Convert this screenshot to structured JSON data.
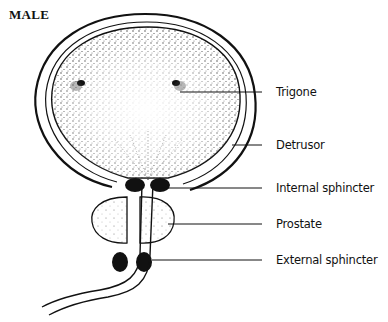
{
  "diagram": {
    "title": "MALE",
    "labels": [
      {
        "id": "trigone",
        "text": "Trigone"
      },
      {
        "id": "detrusor",
        "text": "Detrusor"
      },
      {
        "id": "internal-sphincter",
        "text": "Internal sphincter"
      },
      {
        "id": "prostate",
        "text": "Prostate"
      },
      {
        "id": "external-sphincter",
        "text": "External sphincter"
      }
    ],
    "colors": {
      "ink": "#111111",
      "background": "#ffffff",
      "stipple": "#555555"
    }
  }
}
